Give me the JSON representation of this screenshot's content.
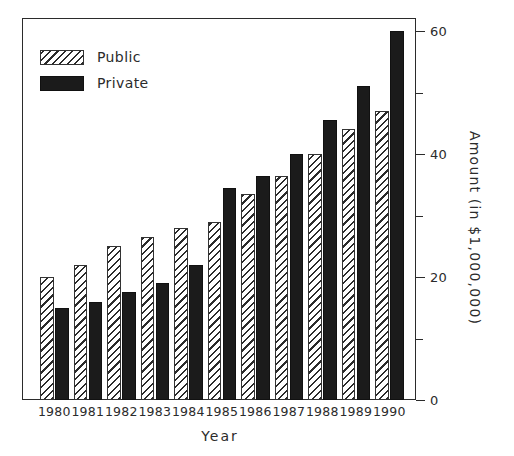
{
  "chart_data": {
    "type": "bar",
    "title": "",
    "xlabel": "Year",
    "ylabel": "Amount (in $1,000,000)",
    "categories": [
      "1980",
      "1981",
      "1982",
      "1983",
      "1984",
      "1985",
      "1986",
      "1987",
      "1988",
      "1989",
      "1990"
    ],
    "series": [
      {
        "name": "Public",
        "fill": "hatched",
        "color": "#ffffff",
        "values": [
          20,
          22,
          25,
          26.5,
          28,
          29,
          33.5,
          36.5,
          40,
          44,
          47
        ]
      },
      {
        "name": "Private",
        "fill": "solid",
        "color": "#1b1b1b",
        "values": [
          15,
          16,
          17.5,
          19,
          22,
          34.5,
          36.5,
          40,
          45.5,
          51,
          60
        ]
      }
    ],
    "ylim": [
      0,
      62
    ],
    "y_major_ticks": [
      0,
      20,
      40,
      60
    ],
    "y_minor_ticks": [
      10,
      30,
      50
    ],
    "y_tick_labels": [
      "0",
      "20",
      "40",
      "60"
    ],
    "y_axis_position": "right",
    "grid": false,
    "legend_position": "top-left"
  },
  "legend": {
    "entries": [
      {
        "label": "Public"
      },
      {
        "label": "Private"
      }
    ]
  },
  "axes": {
    "x_title": "Year",
    "y_title": "Amount (in $1,000,000)"
  }
}
